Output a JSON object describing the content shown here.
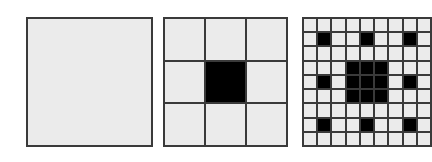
{
  "figure": {
    "colors": {
      "background": "#ffffff",
      "cell_fill": "#ebebeb",
      "removed_fill": "#000000",
      "grid_line": "#3a3a3a"
    },
    "panels": [
      {
        "iteration": 0,
        "grid_size": 1,
        "removed_cells": []
      },
      {
        "iteration": 1,
        "grid_size": 3,
        "removed_cells": [
          [
            1,
            1
          ]
        ]
      },
      {
        "iteration": 2,
        "grid_size": 9,
        "removed_cells": [
          [
            1,
            1
          ],
          [
            1,
            4
          ],
          [
            1,
            7
          ],
          [
            3,
            3
          ],
          [
            3,
            4
          ],
          [
            3,
            5
          ],
          [
            4,
            3
          ],
          [
            4,
            4
          ],
          [
            4,
            5
          ],
          [
            5,
            3
          ],
          [
            5,
            4
          ],
          [
            5,
            5
          ],
          [
            4,
            1
          ],
          [
            4,
            7
          ],
          [
            7,
            1
          ],
          [
            7,
            4
          ],
          [
            7,
            7
          ]
        ],
        "cropped_right": true
      }
    ]
  }
}
